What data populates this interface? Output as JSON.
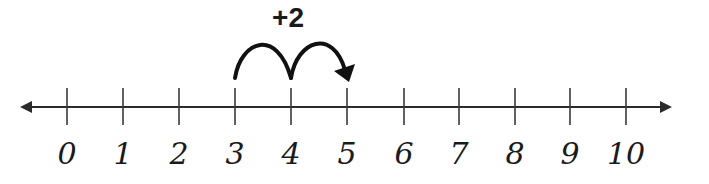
{
  "diagram": {
    "type": "number-line",
    "operation_label": "+2",
    "start": 3,
    "end": 5,
    "hops": [
      {
        "from": 3,
        "to": 4
      },
      {
        "from": 4,
        "to": 5
      }
    ],
    "labels": [
      "0",
      "1",
      "2",
      "3",
      "4",
      "5",
      "6",
      "7",
      "8",
      "9",
      "10"
    ],
    "tick_x": [
      67,
      123,
      179,
      235,
      291,
      347,
      404,
      459,
      515,
      570,
      626
    ],
    "axis_y": 107,
    "axis_x_range": [
      20,
      672
    ],
    "colors": {
      "line": "#2b2b2b",
      "text": "#1a1a1a",
      "background": "#ffffff"
    }
  }
}
